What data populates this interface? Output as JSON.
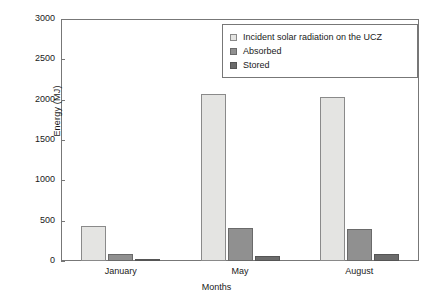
{
  "chart_data": {
    "type": "bar",
    "title": "",
    "xlabel": "Months",
    "ylabel": "Energy (MJ)",
    "categories": [
      "January",
      "May",
      "August"
    ],
    "series": [
      {
        "name": "Incident solar radiation on the UCZ",
        "color": "#e4e4e2",
        "values": [
          440,
          2070,
          2035
        ]
      },
      {
        "name": "Absorbed",
        "color": "#909090",
        "values": [
          85,
          415,
          400
        ]
      },
      {
        "name": "Stored",
        "color": "#6b6b6b",
        "values": [
          15,
          60,
          85
        ]
      }
    ],
    "ylim": [
      0,
      3000
    ],
    "yticks": [
      0,
      500,
      1000,
      1500,
      2000,
      2500,
      3000
    ],
    "ytick_labels": [
      "0",
      "500",
      "1000",
      "1500",
      "2000",
      "2500",
      "3000"
    ],
    "grid": false,
    "legend_position": "upper right"
  },
  "axes": {
    "y_label": "Energy (MJ)",
    "x_label": "Months"
  }
}
